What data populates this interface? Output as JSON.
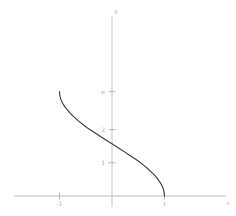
{
  "chart_data": {
    "type": "line",
    "title": "",
    "subtitle": "",
    "xlabel": "x",
    "ylabel": "y",
    "function": "y = arccos(x)",
    "grid": false,
    "legend": null,
    "xlim": [
      -1.45,
      1.38
    ],
    "ylim": [
      -0.42,
      3.9
    ],
    "x_ticks": [
      {
        "value": -1,
        "label": "-1"
      },
      {
        "value": 1,
        "label": "1"
      }
    ],
    "y_ticks": [
      {
        "value": 1,
        "label": "1"
      },
      {
        "value": 2,
        "label": "2"
      },
      {
        "value": 3.14159,
        "label": "π"
      }
    ],
    "series": [
      {
        "name": "arccos(x)",
        "color": "#3c3c3c",
        "x": [
          -1.0,
          -0.99,
          -0.97,
          -0.94,
          -0.9,
          -0.85,
          -0.8,
          -0.72,
          -0.64,
          -0.56,
          -0.48,
          -0.4,
          -0.32,
          -0.24,
          -0.16,
          -0.08,
          0.0,
          0.08,
          0.16,
          0.24,
          0.32,
          0.4,
          0.48,
          0.56,
          0.64,
          0.72,
          0.8,
          0.85,
          0.9,
          0.94,
          0.97,
          0.99,
          1.0
        ],
        "y": [
          3.1416,
          3.0002,
          2.8952,
          2.7943,
          2.6906,
          2.5928,
          2.4981,
          2.3746,
          2.2633,
          2.16,
          2.0629,
          1.9823,
          1.8965,
          1.8128,
          1.7315,
          1.6509,
          1.5708,
          1.4907,
          1.4101,
          1.3288,
          1.2451,
          1.1593,
          1.0787,
          0.9816,
          0.8783,
          0.767,
          0.6435,
          0.5548,
          0.451,
          0.3478,
          0.2456,
          0.1415,
          0.0
        ]
      }
    ]
  },
  "axes": {
    "x_axis_name": "x-axis",
    "y_axis_name": "y-axis",
    "axis_color": "#bcbcbc",
    "tick_color": "#b5b5b5",
    "curve_color": "#3c3c3c",
    "background": "#ffffff"
  }
}
